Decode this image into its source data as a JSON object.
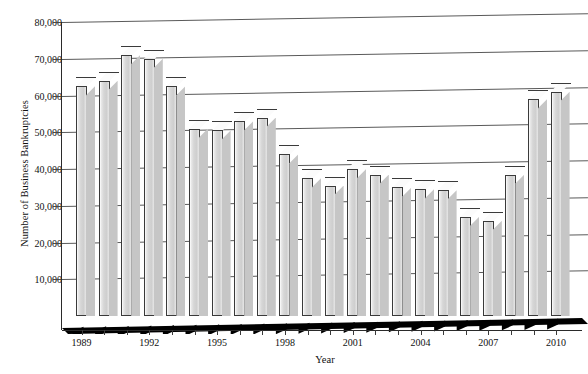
{
  "chart_data": {
    "type": "bar",
    "title": "",
    "xlabel": "Year",
    "ylabel": "Number of Business Bankruptcies",
    "ylim": [
      0,
      80000
    ],
    "ytick_step": 10000,
    "yticks": [
      "10,000",
      "20,000",
      "30,000",
      "40,000",
      "50,000",
      "60,000",
      "70,000",
      "80,000"
    ],
    "ytick_values": [
      10000,
      20000,
      30000,
      40000,
      50000,
      60000,
      70000,
      80000
    ],
    "grid": true,
    "legend": "none",
    "style": "3d-column",
    "note_cropped_right": "chart continues past right edge of screenshot",
    "xtick_labels": [
      "1989",
      "1992",
      "1995",
      "1998",
      "2001",
      "2004",
      "2007",
      "2010"
    ],
    "categories": [
      "1989",
      "1990",
      "1991",
      "1992",
      "1993",
      "1994",
      "1995",
      "1996",
      "1997",
      "1998",
      "1999",
      "2000",
      "2001",
      "2002",
      "2003",
      "2004",
      "2005",
      "2006",
      "2007",
      "2008",
      "2009",
      "2010"
    ],
    "values": [
      62500,
      64000,
      71000,
      70000,
      62500,
      51000,
      50500,
      53000,
      54000,
      44000,
      37500,
      35500,
      40000,
      38500,
      35000,
      34500,
      34200,
      27000,
      25900,
      38500,
      59000,
      61000
    ]
  },
  "axes": {
    "y_title": "Number of Business Bankruptcies",
    "x_title": "Year"
  },
  "colors": {
    "bar_face": "#d6d6d6",
    "bar_top": "#fcfcfc",
    "bar_outline": "#3a3a3a",
    "gridline": "#5a5a5a",
    "floor": "#000000",
    "background": "#ffffff",
    "text": "#111111"
  }
}
